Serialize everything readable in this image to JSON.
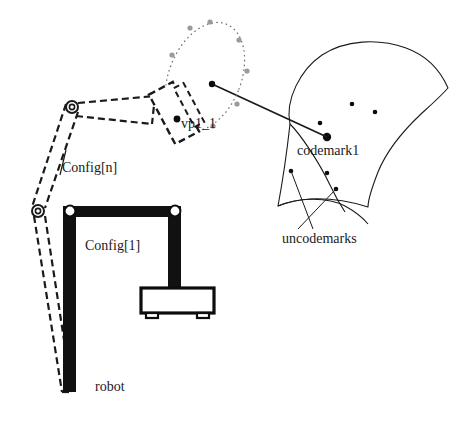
{
  "figure": {
    "type": "technical-diagram",
    "background_color": "#ffffff",
    "line_color": "#1a1a1a",
    "dashed_color": "#1a1a1a",
    "sphere_dot_color": "#9a9a9a",
    "solid_fill_color": "#111111"
  },
  "labels": {
    "viewpoint": "vp1_1",
    "config_n": "Config[n]",
    "config_1": "Config[1]",
    "robot": "robot",
    "codemark": "codemark1",
    "uncodemarks": "uncodemarks"
  },
  "label_positions": {
    "viewpoint": {
      "x": 181,
      "y": 128
    },
    "config_n": {
      "x": 62,
      "y": 172
    },
    "config_1": {
      "x": 85,
      "y": 250
    },
    "robot": {
      "x": 95,
      "y": 391
    },
    "codemark": {
      "x": 297,
      "y": 155
    },
    "uncodemarks": {
      "x": 282,
      "y": 243
    }
  },
  "viewpoint_sphere": {
    "description": "dotted ellipse of candidate viewpoints around the camera target",
    "center": {
      "x": 205,
      "y": 77
    },
    "radius_x": 36,
    "radius_y": 57,
    "rotation_deg": 22,
    "stroke_dash": "1.6 3.2",
    "stroke_color": "#6e6e6e",
    "dots": [
      {
        "x": 210,
        "y": 22,
        "r": 2.6
      },
      {
        "x": 239,
        "y": 40,
        "r": 2.6
      },
      {
        "x": 247,
        "y": 71,
        "r": 2.6
      },
      {
        "x": 237,
        "y": 104,
        "r": 2.6
      },
      {
        "x": 213,
        "y": 126,
        "r": 2.6
      },
      {
        "x": 180,
        "y": 121,
        "r": 2.6
      },
      {
        "x": 168,
        "y": 92,
        "r": 2.6
      },
      {
        "x": 172,
        "y": 55,
        "r": 2.6
      },
      {
        "x": 190,
        "y": 28,
        "r": 2.6
      }
    ]
  },
  "sight_line": {
    "description": "line of sight from viewpoint node to codemark1",
    "from": {
      "x": 212,
      "y": 84
    },
    "to": {
      "x": 327,
      "y": 137
    },
    "endpoint_dot_r": 3.2
  },
  "camera": {
    "description": "dashed rectangle representing the camera / end effector at Config[n]",
    "center": {
      "x": 174,
      "y": 113
    },
    "width": 27,
    "height": 56,
    "rotation_deg": -28,
    "mount_center": {
      "x": 173,
      "y": 113
    },
    "viewpoint_dot": {
      "x": 177,
      "y": 119,
      "r": 3.4
    }
  },
  "dashed_robot": {
    "description": "dashed outline of the robot in Config[n]",
    "joints": [
      {
        "name": "elbow-joint",
        "x": 72,
        "y": 107,
        "r_outer": 6.0,
        "r_inner": 2.6
      },
      {
        "name": "shoulder-joint",
        "x": 38,
        "y": 211,
        "r_outer": 6.0,
        "r_inner": 2.6
      }
    ],
    "links": [
      {
        "name": "upper-link-top",
        "points": "78,103 155,96"
      },
      {
        "name": "upper-link-bottom",
        "points": "76,116 152,124"
      },
      {
        "name": "upper-link-cap",
        "points": "155,96 152,124"
      },
      {
        "name": "vertical-link-left",
        "points": "66,104 32,207"
      },
      {
        "name": "vertical-link-right",
        "points": "78,112 45,208"
      },
      {
        "name": "lower-link-left",
        "points": "34,216 62,392"
      },
      {
        "name": "lower-link-right",
        "points": "45,216 72,392"
      },
      {
        "name": "lower-link-cap",
        "points": "62,392 72,392"
      }
    ]
  },
  "solid_robot": {
    "description": "solid black robot gantry in Config[1] with base",
    "bars": [
      {
        "name": "vertical-column",
        "x": 63,
        "y": 206,
        "w": 13,
        "h": 186
      },
      {
        "name": "horizontal-beam",
        "x": 63,
        "y": 206,
        "w": 118,
        "h": 11
      },
      {
        "name": "right-column",
        "x": 168,
        "y": 206,
        "w": 13,
        "h": 82
      }
    ],
    "joint_circles": [
      {
        "name": "left-pivot",
        "x": 70,
        "y": 211,
        "r_outer": 5.4
      },
      {
        "name": "right-pivot",
        "x": 175,
        "y": 211,
        "r_outer": 5.4
      }
    ],
    "base": {
      "name": "robot-base",
      "x": 141,
      "y": 288,
      "w": 73,
      "h": 25,
      "fill": "#ffffff",
      "stroke_width": 3.2,
      "feet": [
        {
          "x": 146,
          "y": 313,
          "w": 12,
          "h": 5
        },
        {
          "x": 197,
          "y": 313,
          "w": 12,
          "h": 5
        }
      ]
    }
  },
  "curved_surface": {
    "description": "curved workpiece surface carrying the marks",
    "outline_path": "M 290,124 C 285,100 300,70 322,55 C 345,40 378,38 406,48 C 428,56 441,72 448,88 C 441,96 432,104 421,114 C 404,130 387,150 378,172 C 371,190 368,200 368,207 C 352,202 330,198 310,199 C 296,200 286,203 278,206 C 281,190 286,160 290,124 Z",
    "inner_fold_path": "M 290,124 C 300,134 318,160 330,185 C 337,200 341,206 345,212",
    "bottom_edge_path": "M 278,206 C 296,198 326,196 345,206 C 356,212 363,218 368,224",
    "codemark": {
      "name": "codemark1",
      "x": 327,
      "y": 137,
      "r": 4.2
    },
    "uncodemarks": [
      {
        "x": 352,
        "y": 104,
        "r": 2.3
      },
      {
        "x": 375,
        "y": 112,
        "r": 2.3
      },
      {
        "x": 320,
        "y": 123,
        "r": 2.3
      },
      {
        "x": 291,
        "y": 171,
        "r": 2.3
      },
      {
        "x": 327,
        "y": 173,
        "r": 2.3
      },
      {
        "x": 336,
        "y": 189,
        "r": 2.3
      }
    ],
    "leader_lines": [
      {
        "name": "leader-left",
        "from": {
          "x": 291,
          "y": 171
        },
        "to": {
          "x": 313,
          "y": 229
        }
      },
      {
        "name": "leader-right",
        "from": {
          "x": 336,
          "y": 189
        },
        "to": {
          "x": 298,
          "y": 229
        }
      }
    ]
  },
  "config_n_leader": {
    "name": "config-n-tick",
    "from": {
      "x": 66,
      "y": 150
    },
    "to": {
      "x": 60,
      "y": 175
    }
  }
}
